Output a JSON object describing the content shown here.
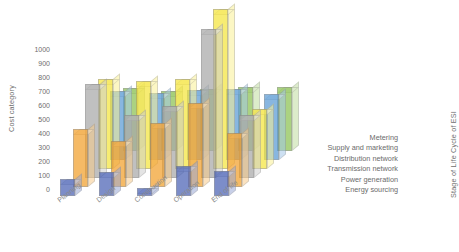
{
  "chart_data": {
    "type": "bar",
    "subtype": "3d-grouped-bar",
    "title": "",
    "xlabel": "",
    "ylabel": "Cost category",
    "zlabel": "Stage of Life Cycle of ESI",
    "categories": [
      "Planning",
      "Design",
      "Construction",
      "Operation",
      "End of life"
    ],
    "ylim": [
      0,
      1000
    ],
    "yticks": [
      1000,
      900,
      800,
      700,
      600,
      500,
      400,
      300,
      200,
      100,
      0
    ],
    "grid": false,
    "legend_position": "right-depth-axis",
    "series": [
      {
        "name": "Energy sourcing",
        "color": "#4a62b5",
        "values": [
          120,
          170,
          60,
          215,
          180
        ]
      },
      {
        "name": "Power generation",
        "color": "#f2a02c",
        "values": [
          410,
          330,
          455,
          600,
          385
        ]
      },
      {
        "name": "Transmission network",
        "color": "#a8a8a8",
        "values": [
          670,
          450,
          510,
          1060,
          445
        ]
      },
      {
        "name": "Distribution network",
        "color": "#f5e53c",
        "values": [
          640,
          625,
          640,
          1140,
          430
        ]
      },
      {
        "name": "Supply and marketing",
        "color": "#5b9bd5",
        "values": [
          490,
          475,
          500,
          505,
          470
        ]
      },
      {
        "name": "Metering",
        "color": "#8cc152",
        "values": [
          445,
          430,
          440,
          455,
          455
        ]
      }
    ]
  },
  "icons": {
    "chart": "bar-chart-3d-icon"
  }
}
